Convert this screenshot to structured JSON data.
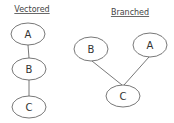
{
  "diagrams": [
    {
      "title": "Vectored",
      "nodes": [
        {
          "label": "A",
          "cx": 28,
          "cy": 34
        },
        {
          "label": "B",
          "cx": 29,
          "cy": 69
        },
        {
          "label": "C",
          "cx": 29,
          "cy": 107
        }
      ],
      "edges": [
        [
          "A",
          "B"
        ],
        [
          "B",
          "C"
        ]
      ]
    },
    {
      "title": "Branched",
      "nodes": [
        {
          "label": "B",
          "cx": 91,
          "cy": 49
        },
        {
          "label": "A",
          "cx": 150,
          "cy": 45
        },
        {
          "label": "C",
          "cx": 123,
          "cy": 96
        }
      ],
      "edges": [
        [
          "B",
          "C"
        ],
        [
          "A",
          "C"
        ]
      ]
    }
  ]
}
